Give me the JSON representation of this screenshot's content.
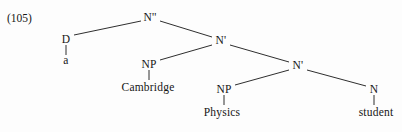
{
  "figure": {
    "example_number": "(105)",
    "background_color": "#fdfdfd",
    "ink_color": "#161616",
    "caption": ""
  },
  "tree": {
    "description": "X-bar phrase structure tree for the noun phrase 'a Cambridge Physics student'",
    "nodes": [
      {
        "id": "nbar2",
        "label": "N''",
        "x": 150,
        "y": 18,
        "type": "category"
      },
      {
        "id": "d",
        "label": "D",
        "x": 66,
        "y": 40,
        "type": "category"
      },
      {
        "id": "a",
        "label": "a",
        "x": 66,
        "y": 61,
        "type": "word"
      },
      {
        "id": "nbar1",
        "label": "N'",
        "x": 221,
        "y": 41,
        "type": "category"
      },
      {
        "id": "np1",
        "label": "NP",
        "x": 149,
        "y": 65,
        "type": "category"
      },
      {
        "id": "cambridge",
        "label": "Cambridge",
        "x": 148,
        "y": 88,
        "type": "word"
      },
      {
        "id": "nbar0",
        "label": "N'",
        "x": 298,
        "y": 66,
        "type": "category"
      },
      {
        "id": "np2",
        "label": "NP",
        "x": 224,
        "y": 90,
        "type": "category"
      },
      {
        "id": "physics",
        "label": "Physics",
        "x": 222,
        "y": 113,
        "type": "word"
      },
      {
        "id": "n",
        "label": "N",
        "x": 374,
        "y": 90,
        "type": "category"
      },
      {
        "id": "student",
        "label": "student",
        "x": 376,
        "y": 113,
        "type": "word"
      }
    ],
    "edges": [
      {
        "from": "nbar2",
        "to": "d",
        "x1": 141,
        "y1": 21,
        "x2": 74,
        "y2": 35
      },
      {
        "from": "nbar2",
        "to": "nbar1",
        "x1": 160,
        "y1": 21,
        "x2": 212,
        "y2": 37
      },
      {
        "from": "d",
        "to": "a",
        "x1": 66,
        "y1": 45,
        "x2": 66,
        "y2": 55
      },
      {
        "from": "nbar1",
        "to": "np1",
        "x1": 212,
        "y1": 45,
        "x2": 160,
        "y2": 60
      },
      {
        "from": "nbar1",
        "to": "nbar0",
        "x1": 230,
        "y1": 45,
        "x2": 289,
        "y2": 62
      },
      {
        "from": "np1",
        "to": "cambridge",
        "x1": 149,
        "y1": 70,
        "x2": 149,
        "y2": 80
      },
      {
        "from": "nbar0",
        "to": "np2",
        "x1": 289,
        "y1": 70,
        "x2": 235,
        "y2": 85
      },
      {
        "from": "nbar0",
        "to": "n",
        "x1": 307,
        "y1": 70,
        "x2": 366,
        "y2": 86
      },
      {
        "from": "np2",
        "to": "physics",
        "x1": 224,
        "y1": 95,
        "x2": 224,
        "y2": 105
      },
      {
        "from": "n",
        "to": "student",
        "x1": 374,
        "y1": 95,
        "x2": 374,
        "y2": 105
      }
    ]
  }
}
